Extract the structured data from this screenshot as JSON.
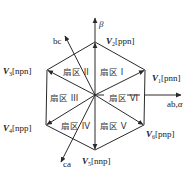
{
  "diagram": {
    "type": "space-vector-hexagon",
    "axes": {
      "alpha": {
        "label": "ab,α",
        "label_prefix": "ab,",
        "label_symbol": "α"
      },
      "beta": {
        "label": "β"
      },
      "bc": {
        "label": "bc"
      },
      "ca": {
        "label": "ca"
      }
    },
    "vectors": [
      {
        "id": "V1",
        "symbol": "V",
        "index": "1",
        "state": "[pnn]"
      },
      {
        "id": "V2",
        "symbol": "V",
        "index": "2",
        "state": "[ppn]"
      },
      {
        "id": "V3",
        "symbol": "V",
        "index": "3",
        "state": "[npn]"
      },
      {
        "id": "V4",
        "symbol": "V",
        "index": "4",
        "state": "[npp]"
      },
      {
        "id": "V5",
        "symbol": "V",
        "index": "5",
        "state": "[nnp]"
      },
      {
        "id": "V6",
        "symbol": "V",
        "index": "6",
        "state": "[pnp]"
      }
    ],
    "sectors": [
      {
        "id": "I",
        "label": "扇区 I"
      },
      {
        "id": "II",
        "label": "扇区 II"
      },
      {
        "id": "III",
        "label": "扇区 III"
      },
      {
        "id": "IV",
        "label": "扇区 IV"
      },
      {
        "id": "V",
        "label": "扇区 V"
      },
      {
        "id": "VI",
        "label": "扇区 VI"
      }
    ],
    "colors": {
      "line": "#2a2a2a",
      "text": "#222222",
      "background": "#ffffff"
    }
  }
}
